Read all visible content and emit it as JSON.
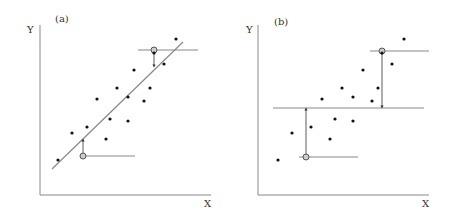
{
  "panels": [
    {
      "label": "(a)",
      "y_axis_label": "Y",
      "x_axis_label": "X",
      "description": "Regression line with residuals",
      "points": [
        [
          58,
          160
        ],
        [
          72,
          133
        ],
        [
          87,
          127
        ],
        [
          97,
          99
        ],
        [
          106,
          139
        ],
        [
          110,
          119
        ],
        [
          117,
          88
        ],
        [
          128,
          121
        ],
        [
          128,
          97
        ],
        [
          134,
          70
        ],
        [
          144,
          101
        ],
        [
          150,
          88
        ],
        [
          164,
          64
        ],
        [
          176,
          39
        ],
        [
          154,
          53
        ]
      ],
      "fit_line": [
        [
          52,
          169
        ],
        [
          183,
          42
        ]
      ],
      "markers": [
        {
          "circle": [
            154,
            50
          ],
          "hline": [
            138,
            198
          ],
          "arrow_to": [
            154,
            66
          ]
        },
        {
          "circle": [
            83,
            156
          ],
          "hline": [
            80,
            135
          ],
          "arrow_to": [
            83,
            140
          ]
        }
      ]
    },
    {
      "label": "(b)",
      "y_axis_label": "Y",
      "x_axis_label": "X",
      "description": "Mean line with deviations",
      "points": [
        [
          278,
          160
        ],
        [
          292,
          133
        ],
        [
          311,
          127
        ],
        [
          322,
          99
        ],
        [
          330,
          139
        ],
        [
          335,
          119
        ],
        [
          342,
          88
        ],
        [
          353,
          121
        ],
        [
          353,
          97
        ],
        [
          363,
          70
        ],
        [
          372,
          101
        ],
        [
          378,
          88
        ],
        [
          392,
          64
        ],
        [
          404,
          39
        ],
        [
          382,
          53
        ]
      ],
      "mean_line": [
        [
          273,
          108
        ],
        [
          424,
          108
        ]
      ],
      "markers": [
        {
          "circle": [
            382,
            51
          ],
          "hline": [
            370,
            429
          ],
          "arrow_to": [
            382,
            107
          ]
        },
        {
          "circle": [
            306,
            157
          ],
          "hline": [
            299,
            358
          ],
          "arrow_to": [
            306,
            109
          ]
        }
      ]
    }
  ]
}
